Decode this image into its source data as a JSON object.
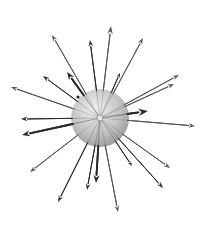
{
  "diagram": {
    "background": "#ffffff",
    "sphere": {
      "cx": 100,
      "cy": 118,
      "r": 29,
      "color_light": "#f2f2f2",
      "color_mid": "#c4c4c4",
      "color_dark": "#8f8f8f"
    },
    "center": {
      "x": 100,
      "y": 118
    },
    "arrow_color_dark": "#2a2a2a",
    "arrow_color_mid": "#555555",
    "arrows": [
      {
        "x": 111,
        "y": 26,
        "w": 1.0,
        "head": 5,
        "shade": "mid"
      },
      {
        "x": 90,
        "y": 40,
        "w": 1.0,
        "head": 4,
        "shade": "dark"
      },
      {
        "x": 143,
        "y": 38,
        "w": 1.0,
        "head": 4,
        "shade": "mid"
      },
      {
        "x": 52,
        "y": 35,
        "w": 1.0,
        "head": 4,
        "shade": "mid"
      },
      {
        "x": 67,
        "y": 72,
        "w": 1.8,
        "head": 5,
        "shade": "dark"
      },
      {
        "x": 43,
        "y": 76,
        "w": 1.0,
        "head": 4,
        "shade": "dark"
      },
      {
        "x": 11,
        "y": 87,
        "w": 1.0,
        "head": 4,
        "shade": "mid"
      },
      {
        "x": 120,
        "y": 73,
        "w": 1.0,
        "head": 3,
        "shade": "dark"
      },
      {
        "x": 179,
        "y": 75,
        "w": 1.0,
        "head": 4,
        "shade": "mid"
      },
      {
        "x": 174,
        "y": 84,
        "w": 1.0,
        "head": 4,
        "shade": "mid"
      },
      {
        "x": 148,
        "y": 111,
        "w": 2.0,
        "head": 6,
        "shade": "dark"
      },
      {
        "x": 195,
        "y": 126,
        "w": 1.0,
        "head": 4,
        "shade": "mid"
      },
      {
        "x": 21,
        "y": 119,
        "w": 1.0,
        "head": 4,
        "shade": "dark"
      },
      {
        "x": 22,
        "y": 135,
        "w": 1.8,
        "head": 5,
        "shade": "dark"
      },
      {
        "x": 30,
        "y": 172,
        "w": 1.0,
        "head": 4,
        "shade": "mid"
      },
      {
        "x": 58,
        "y": 202,
        "w": 1.0,
        "head": 4,
        "shade": "dark"
      },
      {
        "x": 87,
        "y": 190,
        "w": 1.0,
        "head": 4,
        "shade": "dark"
      },
      {
        "x": 96,
        "y": 183,
        "w": 1.8,
        "head": 5,
        "shade": "dark"
      },
      {
        "x": 118,
        "y": 212,
        "w": 1.0,
        "head": 4,
        "shade": "mid"
      },
      {
        "x": 132,
        "y": 166,
        "w": 1.0,
        "head": 3,
        "shade": "dark"
      },
      {
        "x": 163,
        "y": 188,
        "w": 1.0,
        "head": 4,
        "shade": "dark"
      },
      {
        "x": 170,
        "y": 168,
        "w": 1.0,
        "head": 4,
        "shade": "mid"
      }
    ],
    "dots": [
      {
        "x": 78,
        "y": 97,
        "r": 1.6
      }
    ]
  }
}
